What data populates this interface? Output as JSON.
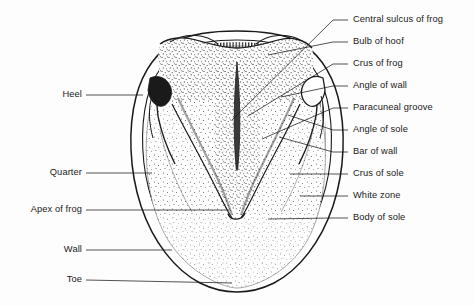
{
  "figure": {
    "background_color": "#fdfdfd",
    "ink_color": "#1a1a1a"
  },
  "labels_right": [
    {
      "text": "Central sulcus of frog",
      "y": 20,
      "leader_to_x": 232,
      "leader_to_y": 120
    },
    {
      "text": "Bulb of hoof",
      "y": 42,
      "leader_to_x": 268,
      "leader_to_y": 55
    },
    {
      "text": "Crus of frog",
      "y": 64,
      "leader_to_x": 248,
      "leader_to_y": 116
    },
    {
      "text": "Angle of wall",
      "y": 86,
      "leader_to_x": 281,
      "leader_to_y": 97
    },
    {
      "text": "Paracuneal groove",
      "y": 108,
      "leader_to_x": 262,
      "leader_to_y": 139
    },
    {
      "text": "Angle of sole",
      "y": 130,
      "leader_to_x": 288,
      "leader_to_y": 115
    },
    {
      "text": "Bar of wall",
      "y": 152,
      "leader_to_x": 279,
      "leader_to_y": 137
    },
    {
      "text": "Crus of sole",
      "y": 174,
      "leader_to_x": 290,
      "leader_to_y": 174
    },
    {
      "text": "White zone",
      "y": 196,
      "leader_to_x": 300,
      "leader_to_y": 196
    },
    {
      "text": "Body of sole",
      "y": 218,
      "leader_to_x": 268,
      "leader_to_y": 219
    }
  ],
  "labels_left": [
    {
      "text": "Heel",
      "y": 95,
      "right_x": 82,
      "leader_to_x": 143,
      "leader_to_y": 95
    },
    {
      "text": "Quarter",
      "y": 173,
      "right_x": 82,
      "leader_to_x": 152,
      "leader_to_y": 173
    },
    {
      "text": "Apex of frog",
      "y": 210,
      "right_x": 82,
      "leader_to_x": 229,
      "leader_to_y": 210
    },
    {
      "text": "Wall",
      "y": 250,
      "right_x": 82,
      "leader_to_x": 172,
      "leader_to_y": 250
    },
    {
      "text": "Toe",
      "y": 280,
      "right_x": 82,
      "leader_to_x": 232,
      "leader_to_y": 283
    }
  ]
}
